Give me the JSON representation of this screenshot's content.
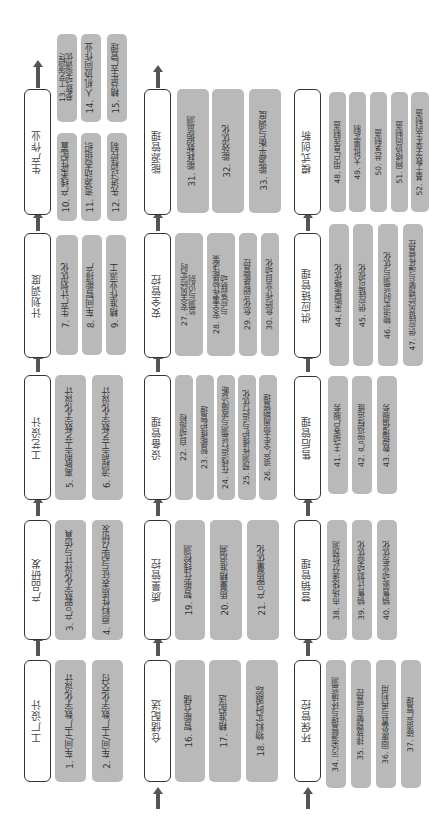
{
  "diagram": {
    "orientation": "rotated 90deg counterclockwise; flow runs bottom-to-top",
    "colors": {
      "header_border": "#333333",
      "header_fill": "#ffffff",
      "item_fill": "#b9b9b9",
      "arrow": "#555555"
    },
    "rows": [
      {
        "stages": [
          {
            "title": "工厂设计",
            "items": [
              "1. 车间/工厂数字化设计",
              "2. 车间/工厂数字化交付"
            ]
          },
          {
            "title": "产品研发",
            "items": [
              "3. 产品数字化设计与仿真",
              "4. 原料性质表征与配方研发"
            ]
          },
          {
            "title": "工艺设计",
            "items": [
              "5. 离散型工艺数字化设计",
              "6. 流程型工艺数字化设计"
            ]
          },
          {
            "title": "计划调度",
            "items": [
              "7. 生产计划优化",
              "8. 车间智能排产",
              "9. 精准作业派工"
            ]
          },
          {
            "title": "生产作业",
            "items": [
              "10. 产线柔性配置",
              "11. 资源动态组织",
              "12. 先进过程控制",
              "13. 工艺流程/\n参数动态调优",
              "14. 人机协同作业",
              "15. 精益生产管理"
            ]
          }
        ]
      },
      {
        "stages": [
          {
            "title": "仓储配送",
            "items": [
              "16. 智能仓储",
              "17. 精准配送",
              "18. 物料实时跟踪"
            ]
          },
          {
            "title": "质量管控",
            "items": [
              "19. 智能在线检测",
              "20. 质量精准追溯",
              "21. 产品质量优化"
            ]
          },
          {
            "title": "设备管理",
            "items": [
              "22. 自动巡检",
              "23. 智能维护管理",
              "24. 在线运行监测与故障诊断",
              "25. 预测性维护与运行优化",
              "26. 资产全生命周期管理"
            ]
          },
          {
            "title": "安全管控",
            "items": [
              "27. 安全风险实时\n监测与识别",
              "28. 安全事件智能决策\n与应急联动",
              "29. 危化品智能管控",
              "30. 危险作业自动化"
            ]
          },
          {
            "title": "能源管理",
            "items": [
              "31. 能耗数据监测",
              "32. 能效优化",
              "33. 能源平衡与调度"
            ]
          }
        ]
      },
      {
        "stages": [
          {
            "title": "环保管控",
            "items": [
              "34. 污染源管理与环境监测",
              "35. 排放预警与管控",
              "36. 固废处置与再利用",
              "37. 碳资产管理"
            ]
          },
          {
            "title": "营销管理",
            "items": [
              "38. 市场快速分析预测",
              "39. 销售计划动态优化",
              "40. 销售驱动业务优化"
            ]
          },
          {
            "title": "售后管理",
            "items": [
              "41. 主动客户服务",
              "42. 产品远程运维",
              "43. 数据增值服务"
            ]
          },
          {
            "title": "供应链管理",
            "items": [
              "44. 采购策略优化",
              "45. 供应链可视化",
              "46. 物流实时监测与优化",
              "47. 供应链风险预警与弹性管控"
            ]
          },
          {
            "title": "模式创新",
            "items": [
              "48. 用户直连制造",
              "49. 大批量定制",
              "50. 共享制造",
              "51. 网络协同制造",
              "52. 基于数字孪生的制造"
            ]
          }
        ]
      }
    ]
  }
}
